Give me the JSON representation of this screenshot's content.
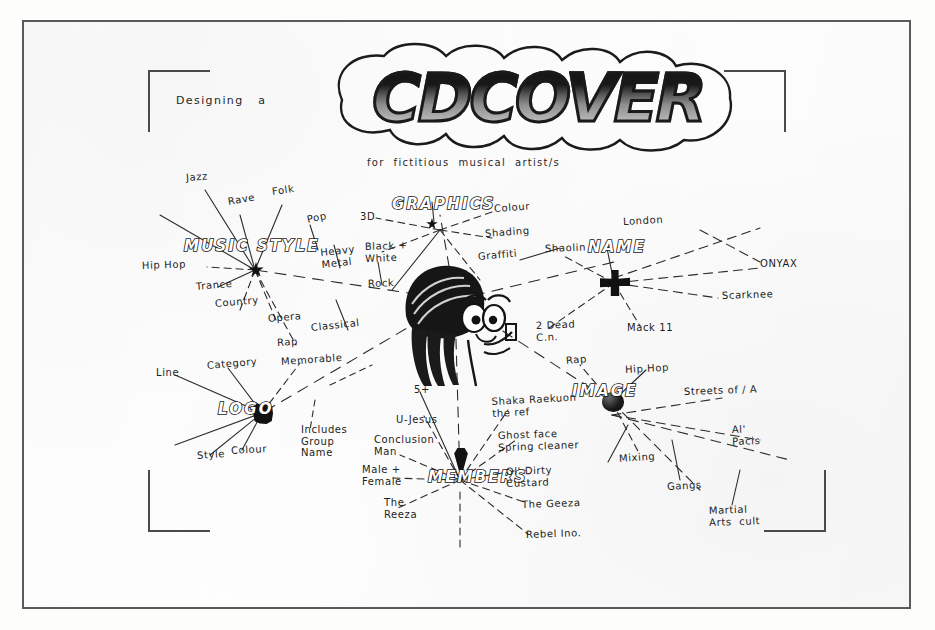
{
  "document": {
    "heading_prefix": "Designing   a",
    "title": "CDCOVER",
    "subtitle": "for  fictitious  musical  artist/s"
  },
  "nodes": {
    "music_style": "MUSIC STYLE",
    "graphics": "GRAPHICS",
    "name": "NAME",
    "logo": "LOGO",
    "image": "IMAGE",
    "members": "MEMBERS"
  },
  "branches": {
    "music_style": {
      "label": "MUSIC STYLE",
      "items": [
        "Jazz",
        "Rave",
        "Folk",
        "Pop",
        "Heavy\nMetal",
        "Hip Hop",
        "Trance",
        "Country",
        "Opera",
        "Rap",
        "Classical",
        "Rock"
      ]
    },
    "graphics": {
      "label": "GRAPHICS",
      "items": [
        "3D",
        "Colour",
        "Shading",
        "Black +\nWhite",
        "Graffiti"
      ]
    },
    "name": {
      "label": "NAME",
      "items": [
        "London",
        "Shaolin",
        "ONYAX",
        "Scarknee",
        "2 Dead\nC.n.",
        "Mack 11"
      ]
    },
    "logo": {
      "label": "LOGO",
      "items": [
        "Line",
        "Category",
        "Memorable",
        "Style",
        "Colour",
        "Includes\nGroup\nName"
      ]
    },
    "image": {
      "label": "IMAGE",
      "items": [
        "Rap",
        "Hip Hop",
        "Streets of / A",
        "Al'\nPacis",
        "Mixing",
        "Gangs",
        "Martial\nArts  cult"
      ]
    },
    "members": {
      "label": "MEMBERS",
      "items": [
        "5+",
        "U-Jesus",
        "Conclusion\nMan",
        "Male +\nFemale",
        "The\nReeza",
        "Shaka Raekuon\nthe ref",
        "Ghost face\nSpring cleaner",
        "Ol' Dirty\nCustard",
        "The Geeza",
        "Rebel Ino."
      ]
    }
  },
  "colors": {
    "ink": "#1c1c1c",
    "paper": "#fefefe",
    "frame": "#5a5a5a",
    "bracket": "#4a4a4a"
  }
}
